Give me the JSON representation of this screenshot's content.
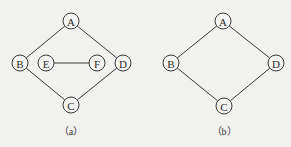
{
  "diagrams": [
    {
      "id": "a",
      "caption": "（a）",
      "nodes": [
        {
          "id": "A",
          "label": "A",
          "x": 71,
          "y": 21
        },
        {
          "id": "B",
          "label": "B",
          "x": 20,
          "y": 63
        },
        {
          "id": "E",
          "label": "E",
          "x": 46,
          "y": 63
        },
        {
          "id": "F",
          "label": "F",
          "x": 97,
          "y": 63
        },
        {
          "id": "D",
          "label": "D",
          "x": 123,
          "y": 63
        },
        {
          "id": "C",
          "label": "C",
          "x": 71,
          "y": 105
        }
      ],
      "edges": [
        [
          "A",
          "B"
        ],
        [
          "A",
          "D"
        ],
        [
          "B",
          "C"
        ],
        [
          "C",
          "D"
        ],
        [
          "E",
          "F"
        ]
      ],
      "caption_pos": {
        "x": 71,
        "y": 131
      }
    },
    {
      "id": "b",
      "caption": "（b）",
      "nodes": [
        {
          "id": "A",
          "label": "A",
          "x": 223,
          "y": 21
        },
        {
          "id": "B",
          "label": "B",
          "x": 171,
          "y": 63
        },
        {
          "id": "D",
          "label": "D",
          "x": 276,
          "y": 63
        },
        {
          "id": "C",
          "label": "C",
          "x": 224,
          "y": 106
        }
      ],
      "edges": [
        [
          "A",
          "B"
        ],
        [
          "A",
          "D"
        ],
        [
          "B",
          "C"
        ],
        [
          "C",
          "D"
        ]
      ],
      "caption_pos": {
        "x": 224,
        "y": 131
      }
    }
  ],
  "style": {
    "node_radius": 8,
    "line_color": "#3a3a3a",
    "background": "#f1f1ef"
  }
}
